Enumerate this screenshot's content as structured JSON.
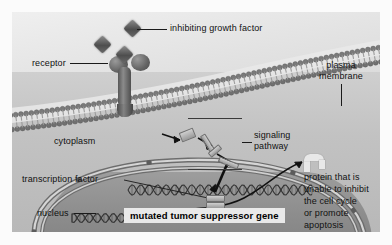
{
  "figure": {
    "caption": "mutated tumor suppressor gene"
  },
  "labels": {
    "inhibiting_growth_factor": "inhibiting growth factor",
    "receptor": "receptor",
    "plasma_membrane_line1": "plasma",
    "plasma_membrane_line2": "membrane",
    "cytoplasm": "cytoplasm",
    "signaling_line1": "signaling",
    "signaling_line2": "pathway",
    "transcription_factor": "transcription factor",
    "nucleus": "nucleus",
    "protein_line1": "protein that is",
    "protein_line2": "unable to inhibit",
    "protein_line3": "the cell cycle",
    "protein_line4": "or promote",
    "protein_line5": "apoptosis"
  },
  "icons": {
    "growth_factor": "diamond-ligand-icon",
    "receptor": "y-shaped-receptor-icon",
    "membrane": "phospholipid-bilayer-icon",
    "nuclear_envelope": "nuclear-envelope-icon",
    "dna": "dna-double-helix-icon",
    "protein": "misfolded-protein-icon",
    "arrow": "arrow-icon"
  },
  "colors": {
    "extracellular": "#e2e2e2",
    "cytoplasm": "#c2c2c2",
    "nucleoplasm": "#8d8d8d",
    "membrane_head": "#6f6f6f",
    "text": "#111111",
    "banner_bg": "#e9e9e9",
    "leader": "#1a1a1a"
  }
}
